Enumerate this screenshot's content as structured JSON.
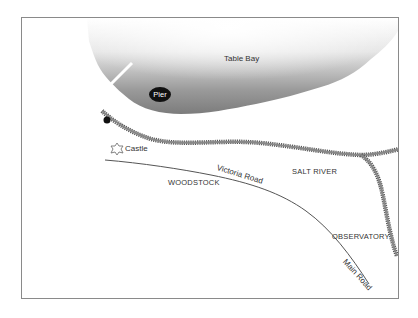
{
  "map": {
    "water_body": "Table Bay",
    "landmarks": [
      {
        "name": "Pier",
        "style": "black-badge"
      },
      {
        "name": "Castle",
        "icon": "castle-icon"
      }
    ],
    "areas": [
      "WOODSTOCK",
      "SALT RIVER",
      "OBSERVATORY"
    ],
    "roads": [
      "Victoria Road",
      "Main Road"
    ],
    "features": [
      "railway-line",
      "shoreline",
      "pier"
    ],
    "colors": {
      "water_dark": "#7a7a7a",
      "water_light": "#f2f2f2",
      "railway": "#6e6e6e",
      "road": "#555555",
      "frame": "#8a8a8a"
    }
  }
}
